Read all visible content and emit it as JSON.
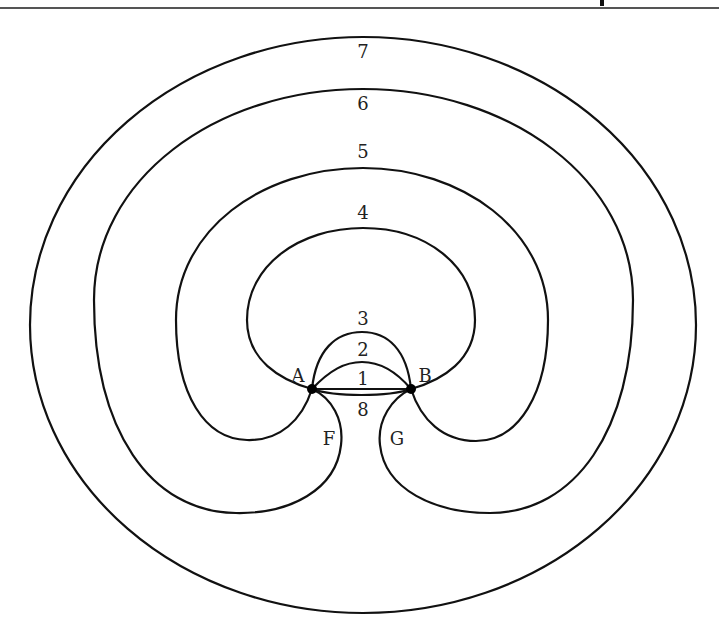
{
  "diagram": {
    "type": "graph-embedding",
    "vertices": [
      {
        "id": "A",
        "label": "A",
        "x": 312,
        "y": 389
      },
      {
        "id": "B",
        "label": "B",
        "x": 411,
        "y": 389
      }
    ],
    "edge_labels": {
      "e1": "1",
      "e2": "2",
      "e3": "3",
      "e4": "4",
      "e5": "5",
      "e6": "6",
      "e7": "7",
      "e8": "8"
    },
    "region_labels": {
      "F": "F",
      "G": "G"
    },
    "colors": {
      "stroke": "#111111",
      "background": "#ffffff",
      "rule": "#555555"
    }
  }
}
